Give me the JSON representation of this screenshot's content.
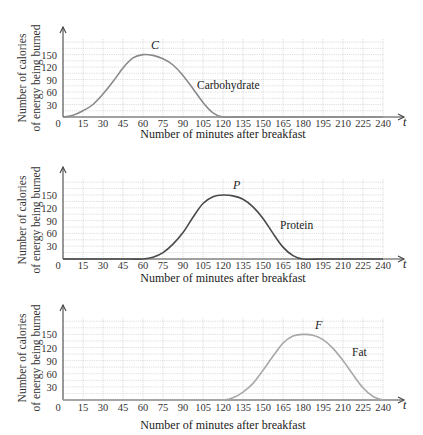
{
  "chart_data": [
    {
      "type": "line",
      "title": "",
      "xlabel": "Number of minutes after breakfast",
      "ylabel": "Number of calories of energy being burned",
      "ylabel_lines": [
        "Number of calories",
        "of energy being burned"
      ],
      "x_axis_var": "t",
      "xticks": [
        0,
        15,
        30,
        45,
        60,
        75,
        90,
        105,
        120,
        135,
        150,
        165,
        180,
        195,
        210,
        225,
        240
      ],
      "yticks": [
        30,
        60,
        90,
        120,
        150
      ],
      "xlim": [
        0,
        240
      ],
      "ylim": [
        0,
        187.5
      ],
      "grid": true,
      "series": [
        {
          "name": "Carbohydrate",
          "peak_label": "C",
          "color": "#8a8a8a",
          "x": [
            0,
            7.5,
            15,
            22.5,
            30,
            37.5,
            45,
            52.5,
            60,
            67.5,
            75,
            82.5,
            90,
            97.5,
            105,
            112.5,
            120,
            135,
            150,
            165,
            180,
            195,
            210,
            225,
            240
          ],
          "values": [
            0,
            4,
            15,
            30,
            55,
            85,
            118,
            142,
            150,
            148,
            140,
            125,
            100,
            68,
            35,
            10,
            0,
            0,
            0,
            0,
            0,
            0,
            0,
            0,
            0
          ]
        }
      ]
    },
    {
      "type": "line",
      "title": "",
      "xlabel": "Number of minutes after breakfast",
      "ylabel": "Number of calories of energy being burned",
      "ylabel_lines": [
        "Number of calories",
        "of energy being burned"
      ],
      "x_axis_var": "t",
      "xticks": [
        0,
        15,
        30,
        45,
        60,
        75,
        90,
        105,
        120,
        135,
        150,
        165,
        180,
        195,
        210,
        225,
        240
      ],
      "yticks": [
        30,
        60,
        90,
        120,
        150
      ],
      "xlim": [
        0,
        240
      ],
      "ylim": [
        0,
        187.5
      ],
      "grid": true,
      "series": [
        {
          "name": "Protein",
          "peak_label": "P",
          "color": "#4a4a4a",
          "x": [
            0,
            15,
            30,
            45,
            60,
            67.5,
            75,
            82.5,
            90,
            97.5,
            105,
            112.5,
            120,
            127.5,
            135,
            142.5,
            150,
            157.5,
            165,
            172.5,
            180,
            195,
            210,
            225,
            240
          ],
          "values": [
            0,
            0,
            0,
            0,
            0,
            4,
            15,
            35,
            62,
            98,
            130,
            146,
            150,
            148,
            140,
            122,
            95,
            60,
            28,
            8,
            0,
            0,
            0,
            0,
            0
          ]
        }
      ]
    },
    {
      "type": "line",
      "title": "",
      "xlabel": "Number of minutes after breakfast",
      "ylabel": "Number of calories of energy being burned",
      "ylabel_lines": [
        "Number of calories",
        "of energy being burned"
      ],
      "x_axis_var": "t",
      "xticks": [
        0,
        15,
        30,
        45,
        60,
        75,
        90,
        105,
        120,
        135,
        150,
        165,
        180,
        195,
        210,
        225,
        240
      ],
      "yticks": [
        30,
        60,
        90,
        120,
        150
      ],
      "xlim": [
        0,
        240
      ],
      "ylim": [
        0,
        187.5
      ],
      "grid": true,
      "series": [
        {
          "name": "Fat",
          "peak_label": "F",
          "color": "#a8a8a8",
          "x": [
            0,
            15,
            30,
            45,
            60,
            75,
            90,
            105,
            120,
            127.5,
            135,
            142.5,
            150,
            157.5,
            165,
            172.5,
            180,
            187.5,
            195,
            202.5,
            210,
            217.5,
            225,
            232.5,
            240
          ],
          "values": [
            0,
            0,
            0,
            0,
            0,
            0,
            0,
            0,
            0,
            5,
            18,
            38,
            68,
            100,
            130,
            146,
            150,
            148,
            138,
            118,
            90,
            58,
            28,
            8,
            0
          ]
        }
      ]
    }
  ],
  "labels": {
    "xlabel": "Number of minutes after breakfast",
    "ylabel_line1": "Number of calories",
    "ylabel_line2": "of energy being burned",
    "t": "t",
    "zero": "0",
    "c1_name": "Carbohydrate",
    "c1_peak": "C",
    "c2_name": "Protein",
    "c2_peak": "P",
    "c3_name": "Fat",
    "c3_peak": "F"
  }
}
